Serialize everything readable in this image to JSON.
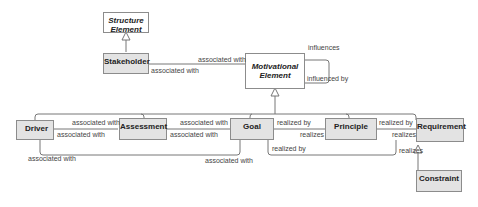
{
  "diagram": {
    "elements": {
      "structure_element": {
        "line1": "Structure",
        "line2": "Element"
      },
      "motivational_element": {
        "line1": "Motivational",
        "line2": "Element"
      },
      "stakeholder": "Stakeholder",
      "driver": "Driver",
      "assessment": "Assessment",
      "goal": "Goal",
      "principle": "Principle",
      "requirement": "Requirement",
      "constraint": "Constraint"
    },
    "relations": {
      "stakeholder_motiv_top": "associated with",
      "stakeholder_motiv_bottom": "associated with",
      "influences": "influences",
      "influenced_by": "influenced by",
      "driver_assessment_top": "associated with",
      "driver_assessment_bottom": "associated with",
      "assessment_goal_top": "associated with",
      "assessment_goal_bottom": "associated with",
      "driver_goal_left": "associated with",
      "driver_goal_right": "associated with",
      "goal_principle_top": "realized by",
      "goal_principle_bottom": "realizes",
      "principle_requirement_top": "realized by",
      "principle_requirement_bottom": "realizes",
      "goal_requirement_left": "realized by",
      "goal_requirement_right": "realizes"
    }
  }
}
